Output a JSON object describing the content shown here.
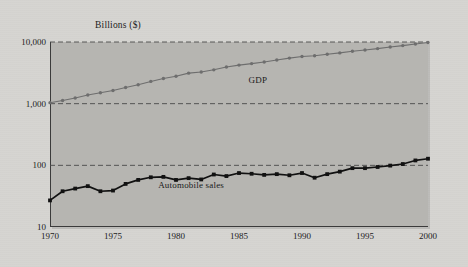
{
  "figure": {
    "background_color": "#d6d5d1",
    "plot_background_color": "#b6b5b1",
    "axis_color": "#3b3b3b"
  },
  "chart_data": {
    "type": "line",
    "title": "",
    "subtitle": "",
    "ylabel": "Billions ($)",
    "xlabel": "",
    "yscale": "log",
    "ylim": [
      10,
      10000
    ],
    "xlim": [
      1970,
      2000
    ],
    "grid": true,
    "grid_style": "dashed-horizontal",
    "legend_position": "inline-annotation",
    "ytick_labels": [
      "10,000",
      "1,000",
      "100",
      "10"
    ],
    "ytick_values": [
      10000,
      1000,
      100,
      10
    ],
    "xtick_labels": [
      "1970",
      "1975",
      "1980",
      "1985",
      "1990",
      "1995",
      "2000"
    ],
    "xtick_values": [
      1970,
      1975,
      1980,
      1985,
      1990,
      1995,
      2000
    ],
    "x": [
      1970,
      1971,
      1972,
      1973,
      1974,
      1975,
      1976,
      1977,
      1978,
      1979,
      1980,
      1981,
      1982,
      1983,
      1984,
      1985,
      1986,
      1987,
      1988,
      1989,
      1990,
      1991,
      1992,
      1993,
      1994,
      1995,
      1996,
      1997,
      1998,
      1999,
      2000
    ],
    "series": [
      {
        "name": "GDP",
        "color": "#6e6e6e",
        "marker": "circle",
        "label_x": 1986.5,
        "label_y": 2450,
        "values": [
          1038,
          1127,
          1238,
          1383,
          1500,
          1638,
          1825,
          2031,
          2295,
          2563,
          2790,
          3128,
          3255,
          3537,
          3933,
          4220,
          4463,
          4740,
          5104,
          5484,
          5803,
          5996,
          6338,
          6657,
          7072,
          7398,
          7817,
          8304,
          8747,
          9268,
          9817
        ]
      },
      {
        "name": "Automobile sales",
        "color": "#111111",
        "marker": "square",
        "label_x": 1981.2,
        "label_y": 48,
        "values": [
          27,
          38,
          42,
          46,
          38,
          39,
          50,
          58,
          64,
          65,
          58,
          62,
          59,
          71,
          67,
          75,
          73,
          70,
          72,
          69,
          75,
          63,
          72,
          79,
          90,
          90,
          94,
          99,
          105,
          120,
          128
        ]
      }
    ]
  }
}
